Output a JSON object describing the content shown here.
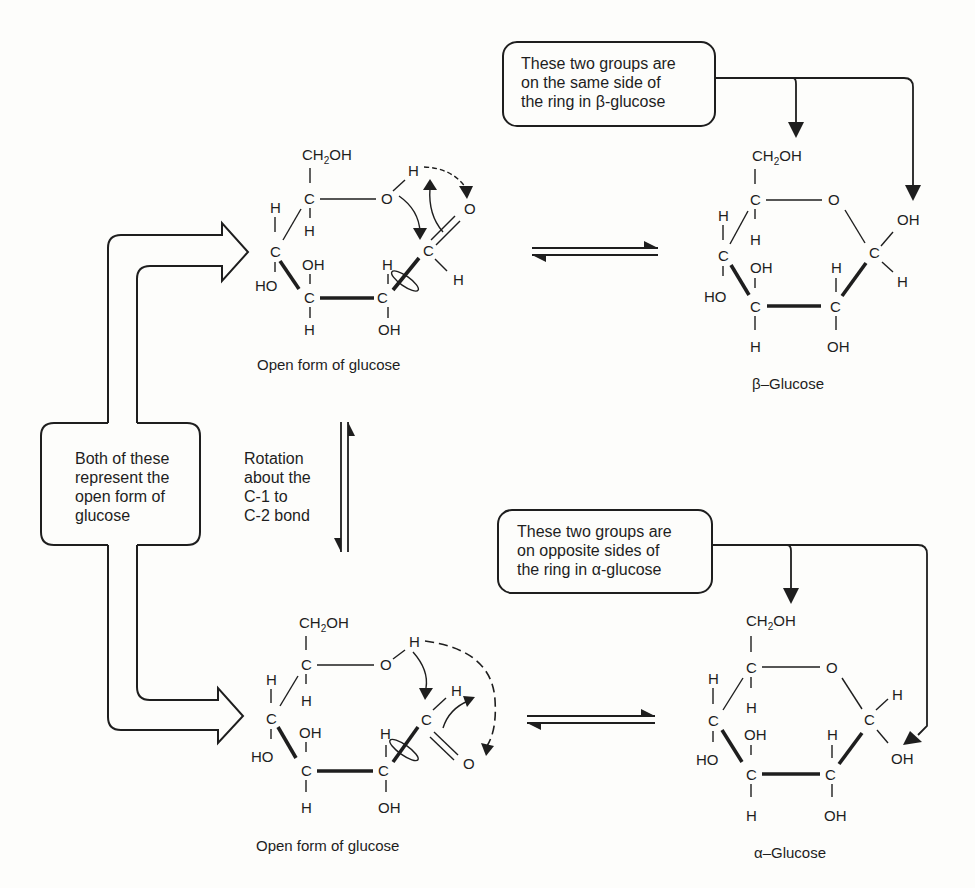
{
  "diagram": {
    "notes": {
      "beta_callout": [
        "These two groups are",
        "on the same side of",
        "the ring in β-glucose"
      ],
      "alpha_callout": [
        "These two groups are",
        "on opposite sides of",
        "the ring in α-glucose"
      ],
      "both_callout": [
        "Both of these",
        "represent the",
        "open form of",
        "glucose"
      ],
      "rotation": [
        "Rotation",
        "about the",
        "C-1 to",
        "C-2 bond"
      ]
    },
    "captions": {
      "open_top": "Open form of glucose",
      "open_bottom": "Open form of glucose",
      "beta": "β–Glucose",
      "alpha": "α–Glucose"
    },
    "atoms": {
      "ch2oh": "CH",
      "ch2oh_sub": "2",
      "ch2oh_tail": "OH",
      "C": "C",
      "O": "O",
      "H": "H",
      "OH": "OH",
      "HO": "HO"
    },
    "arrows": {
      "top_equilibrium": "open form ⇌ β-glucose",
      "bottom_equilibrium": "open form ⇌ α-glucose",
      "vertical_equilibrium": "rotation about C-1 to C-2 bond"
    }
  }
}
